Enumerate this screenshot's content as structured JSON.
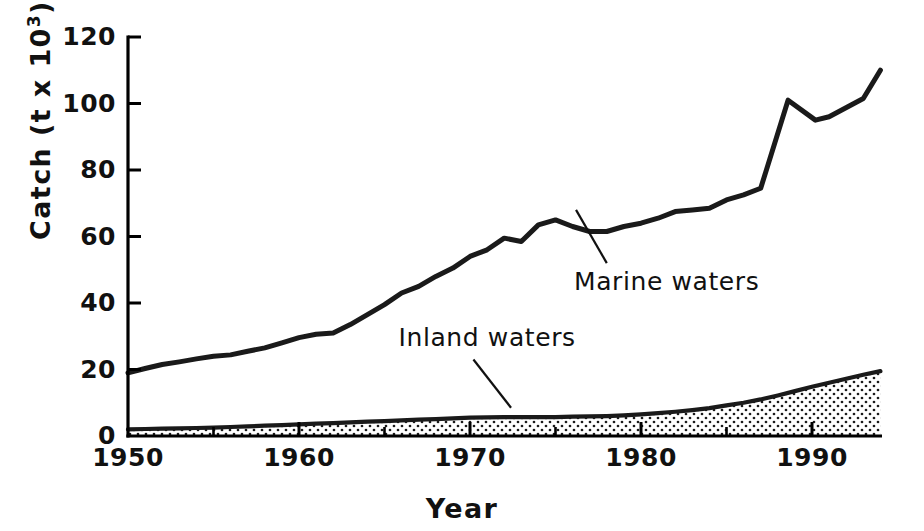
{
  "chart_data": {
    "type": "line",
    "title": "",
    "xlabel": "Year",
    "ylabel": "Catch (t x 10",
    "ylabel_exponent": "3",
    "ylabel_suffix": ")",
    "xlim": [
      1950,
      1994
    ],
    "ylim": [
      0,
      120
    ],
    "grid": false,
    "legend_position": "inline-annotations",
    "y_ticks": [
      0,
      20,
      40,
      60,
      80,
      100,
      120
    ],
    "y_tick_labels": [
      "0",
      "20",
      "40",
      "60",
      "80",
      "100",
      "120"
    ],
    "x_ticks": [
      1950,
      1960,
      1970,
      1980,
      1990
    ],
    "x_tick_labels": [
      "1950",
      "1960",
      "1970",
      "1980",
      "1990"
    ],
    "x_minor_ticks": [
      1955,
      1965,
      1975,
      1985
    ],
    "annotations": [
      {
        "name": "marine-waters-label",
        "text": "Marine waters",
        "x": 1981.5,
        "y": 44,
        "leader_from_x": 1978.0,
        "leader_from_y": 52,
        "leader_to_x": 1976.2,
        "leader_to_y": 68
      },
      {
        "name": "inland-waters-label",
        "text": "Inland waters",
        "x": 1971.0,
        "y": 27,
        "leader_from_x": 1970.2,
        "leader_from_y": 23,
        "leader_to_x": 1972.4,
        "leader_to_y": 8.5
      }
    ],
    "x": [
      1950,
      1951,
      1952,
      1953,
      1954,
      1955,
      1956,
      1957,
      1958,
      1959,
      1960,
      1961,
      1962,
      1963,
      1964,
      1965,
      1966,
      1967,
      1968,
      1969,
      1970,
      1971,
      1972,
      1973,
      1974,
      1975,
      1976,
      1977,
      1978,
      1979,
      1980,
      1981,
      1982,
      1983,
      1984,
      1985,
      1986,
      1987,
      1988,
      1989,
      1990,
      1991,
      1992,
      1993,
      1994
    ],
    "series": [
      {
        "name": "Marine waters",
        "style": "line",
        "color": "#1a1a1a",
        "values": [
          19.0,
          20.3,
          21.5,
          22.3,
          23.2,
          24.0,
          24.4,
          25.5,
          26.5,
          28.0,
          29.6,
          30.6,
          31.0,
          33.5,
          36.5,
          39.5,
          43.0,
          45.0,
          48.0,
          50.5,
          54.0,
          56.0,
          59.5,
          58.5,
          63.5,
          65.0,
          63.0,
          61.5,
          61.5,
          63.0,
          64.0,
          65.5,
          67.5,
          68.0,
          68.5,
          71.0,
          72.5,
          74.5,
          77.5,
          78.0,
          84.0,
          87.0,
          88.0,
          90.5,
          93.0
        ]
      },
      {
        "name": "Inland waters",
        "style": "area",
        "color": "#1a1a1a",
        "fill": "stipple",
        "values": [
          2.0,
          2.1,
          2.2,
          2.3,
          2.4,
          2.5,
          2.7,
          2.9,
          3.1,
          3.3,
          3.5,
          3.7,
          3.9,
          4.1,
          4.3,
          4.5,
          4.7,
          4.9,
          5.1,
          5.3,
          5.5,
          5.6,
          5.7,
          5.7,
          5.7,
          5.7,
          5.8,
          5.9,
          6.0,
          6.2,
          6.5,
          6.9,
          7.3,
          7.8,
          8.4,
          9.2,
          10.0,
          11.0,
          12.2,
          13.5,
          14.8,
          16.0,
          17.2,
          18.4,
          19.5
        ]
      }
    ],
    "marine_extra_points": [
      {
        "x": 1990.2,
        "y": 95.0
      },
      {
        "x": 1991.0,
        "y": 96.0
      },
      {
        "x": 1988.6,
        "y": 101.0
      },
      {
        "x": 1993.0,
        "y": 101.5
      },
      {
        "x": 1994.0,
        "y": 110.0
      }
    ]
  }
}
